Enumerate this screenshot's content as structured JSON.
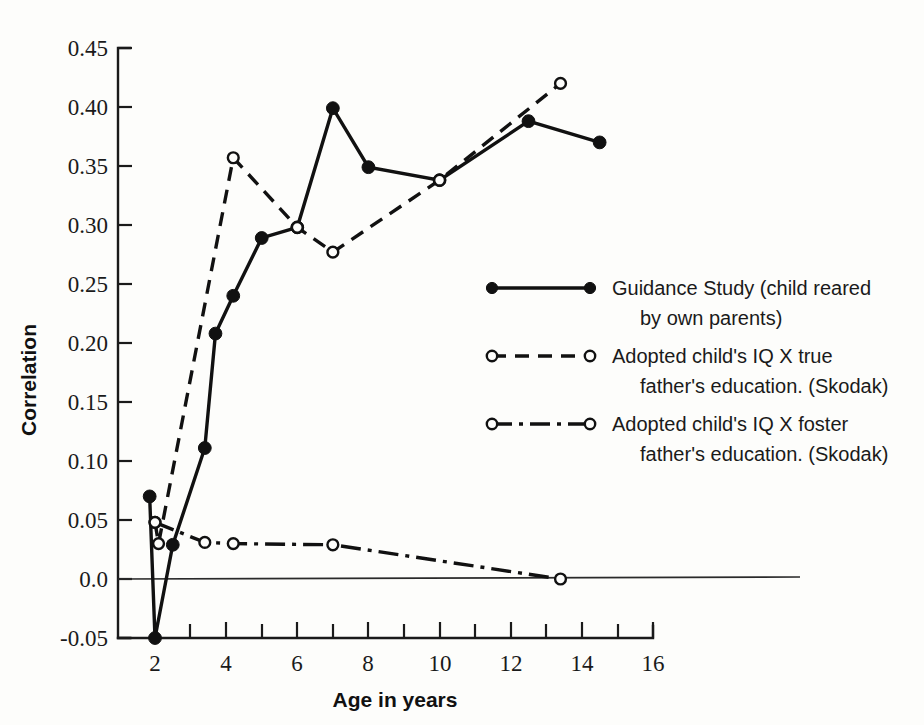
{
  "chart_data": {
    "type": "line",
    "title": "",
    "xlabel": "Age in years",
    "ylabel": "Correlation",
    "xlim": [
      2,
      16
    ],
    "ylim": [
      -0.05,
      0.45
    ],
    "grid": false,
    "legend_position": "center-right",
    "x_ticks": [
      2,
      4,
      6,
      8,
      10,
      12,
      14,
      16
    ],
    "x_tick_labels": [
      "2",
      "4",
      "6",
      "8",
      "10",
      "12",
      "14",
      "16"
    ],
    "x_minor_ticks": [
      3,
      5,
      7,
      9,
      11,
      13,
      15
    ],
    "y_ticks": [
      -0.05,
      0.0,
      0.05,
      0.1,
      0.15,
      0.2,
      0.25,
      0.3,
      0.35,
      0.4,
      0.45
    ],
    "y_tick_labels": [
      "-0.05",
      "0.0",
      "0.05",
      "0.10",
      "0.15",
      "0.20",
      "0.25",
      "0.30",
      "0.35",
      "0.40",
      "0.45"
    ],
    "zero_reference_line": 0.0,
    "series": [
      {
        "name": "Guidance Study (child reared by own parents)",
        "marker": "filled-circle",
        "line_style": "solid",
        "points": [
          {
            "x": 1.85,
            "y": 0.07
          },
          {
            "x": 2.0,
            "y": -0.05
          },
          {
            "x": 2.5,
            "y": 0.029
          },
          {
            "x": 3.4,
            "y": 0.111
          },
          {
            "x": 3.7,
            "y": 0.208
          },
          {
            "x": 4.2,
            "y": 0.24
          },
          {
            "x": 5.0,
            "y": 0.289
          },
          {
            "x": 6.0,
            "y": 0.298
          },
          {
            "x": 7.0,
            "y": 0.399
          },
          {
            "x": 8.0,
            "y": 0.349
          },
          {
            "x": 10.0,
            "y": 0.338
          },
          {
            "x": 12.5,
            "y": 0.388
          },
          {
            "x": 14.5,
            "y": 0.37
          }
        ]
      },
      {
        "name": "Adopted child's IQ X true father's education. (Skodak)",
        "marker": "open-circle",
        "line_style": "dashed",
        "points": [
          {
            "x": 2.0,
            "y": 0.048
          },
          {
            "x": 2.1,
            "y": 0.03
          },
          {
            "x": 4.2,
            "y": 0.357
          },
          {
            "x": 6.0,
            "y": 0.298
          },
          {
            "x": 7.0,
            "y": 0.277
          },
          {
            "x": 10.0,
            "y": 0.338
          },
          {
            "x": 13.4,
            "y": 0.42
          }
        ]
      },
      {
        "name": "Adopted child's IQ X foster father's education. (Skodak)",
        "marker": "open-circle",
        "line_style": "dash-dot",
        "points": [
          {
            "x": 2.0,
            "y": 0.048
          },
          {
            "x": 3.4,
            "y": 0.031
          },
          {
            "x": 4.2,
            "y": 0.03
          },
          {
            "x": 7.0,
            "y": 0.029
          },
          {
            "x": 13.4,
            "y": 0.0
          }
        ]
      }
    ]
  },
  "legend": {
    "entries": [
      {
        "marker": "filled-circle",
        "line_style": "solid",
        "line1": "Guidance Study (child reared",
        "line2": "by own parents)"
      },
      {
        "marker": "open-circle",
        "line_style": "dashed",
        "line1": "Adopted child's IQ X true",
        "line2": "father's education. (Skodak)"
      },
      {
        "marker": "open-circle",
        "line_style": "dash-dot",
        "line1": "Adopted child's IQ X foster",
        "line2": "father's education. (Skodak)"
      }
    ]
  },
  "axes": {
    "x_title": "Age in years",
    "y_title": "Correlation"
  },
  "colors": {
    "ink": "#111111",
    "background": "#fdfdfb"
  }
}
